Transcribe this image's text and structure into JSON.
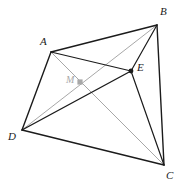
{
  "figure": {
    "width": 179,
    "height": 192,
    "background_color": "#ffffff"
  },
  "colors": {
    "edge_dark": "#1b1b1b",
    "edge_gray": "#a8a8a8",
    "label_dark": "#1b1b1b",
    "label_gray": "#a8a8a8",
    "point_fill": "#1b1b1b",
    "point_fill_gray": "#a8a8a8"
  },
  "points": [
    {
      "id": "A",
      "label": "A",
      "x": 51,
      "y": 52,
      "label_x": 40,
      "label_y": 36,
      "style": "dark",
      "marker": "none"
    },
    {
      "id": "B",
      "label": "B",
      "x": 157,
      "y": 25,
      "label_x": 160,
      "label_y": 6,
      "style": "dark",
      "marker": "none"
    },
    {
      "id": "C",
      "label": "C",
      "x": 164,
      "y": 165,
      "label_x": 166,
      "label_y": 170,
      "style": "dark",
      "marker": "none"
    },
    {
      "id": "D",
      "label": "D",
      "x": 22,
      "y": 130,
      "label_x": 8,
      "label_y": 131,
      "style": "dark",
      "marker": "none"
    },
    {
      "id": "E",
      "label": "E",
      "x": 131,
      "y": 71,
      "label_x": 137,
      "label_y": 62,
      "style": "dark",
      "marker": "dot"
    },
    {
      "id": "M",
      "label": "M",
      "x": 80,
      "y": 82,
      "label_x": 66,
      "label_y": 75,
      "style": "gray",
      "marker": "square"
    }
  ],
  "segments": [
    {
      "id": "AB",
      "from": "A",
      "to": "B",
      "style": "dark",
      "width": 1.4
    },
    {
      "id": "BC",
      "from": "B",
      "to": "C",
      "style": "dark",
      "width": 1.4
    },
    {
      "id": "CD",
      "from": "C",
      "to": "D",
      "style": "dark",
      "width": 1.4
    },
    {
      "id": "DA",
      "from": "D",
      "to": "A",
      "style": "dark",
      "width": 1.4
    },
    {
      "id": "AE",
      "from": "A",
      "to": "E",
      "style": "dark",
      "width": 1.2
    },
    {
      "id": "BE",
      "from": "B",
      "to": "E",
      "style": "dark",
      "width": 1.2
    },
    {
      "id": "CE",
      "from": "C",
      "to": "E",
      "style": "dark",
      "width": 1.2
    },
    {
      "id": "DE",
      "from": "D",
      "to": "E",
      "style": "dark",
      "width": 1.4
    },
    {
      "id": "AC",
      "from": "A",
      "to": "C",
      "style": "gray",
      "width": 1.0
    },
    {
      "id": "DB",
      "from": "D",
      "to": "B",
      "style": "gray",
      "width": 1.0
    }
  ]
}
